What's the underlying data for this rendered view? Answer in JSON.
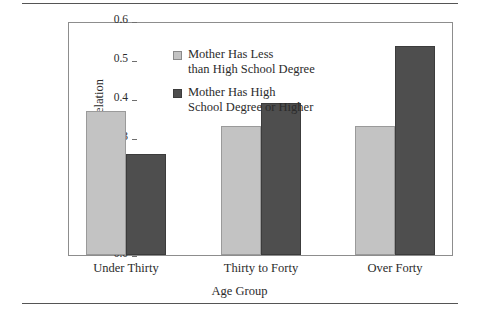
{
  "chart_data": {
    "type": "bar",
    "title": "",
    "xlabel": "Age Group",
    "ylabel": "Intra-Class Correlation",
    "categories": [
      "Under Thirty",
      "Thirty to Forty",
      "Over Forty"
    ],
    "series": [
      {
        "name": "Mother Has Less than High School Degree",
        "name_line1": "Mother Has Less",
        "name_line2": "than High School Degree",
        "color": "#c3c3c3",
        "values": [
          0.37,
          0.33,
          0.33
        ]
      },
      {
        "name": "Mother Has High School Degree or Higher",
        "name_line1": "Mother Has High",
        "name_line2": "School Degree or Higher",
        "color": "#4e4e4e",
        "values": [
          0.26,
          0.39,
          0.535
        ]
      }
    ],
    "ylim": [
      0.0,
      0.6
    ],
    "ytick_values": [
      0.0,
      0.1,
      0.2,
      0.3,
      0.4,
      0.5,
      0.6
    ],
    "ytick_labels": [
      "0.0",
      "0.1",
      "0.2",
      "0.3",
      "0.4",
      "0.5",
      "0.6"
    ],
    "grid": false,
    "legend_position": "upper-center-inside",
    "frame": true
  }
}
